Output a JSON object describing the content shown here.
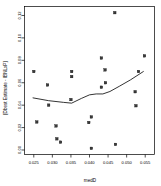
{
  "chart_data": {
    "type": "scatter",
    "title": "",
    "xlabel": "medD",
    "ylabel": "[Dbest Estimate - IBNLxP]",
    "xlim": [
      0.0225,
      0.0575
    ],
    "ylim": [
      -0.004,
      0.128
    ],
    "grid": false,
    "legend": null,
    "xticks": [
      0.025,
      0.03,
      0.035,
      0.04,
      0.045,
      0.05,
      0.055
    ],
    "xticklabels": [
      "0.025",
      "0.030",
      "0.035",
      "0.040",
      "0.045",
      "0.050",
      "0.055"
    ],
    "yticks": [
      0.0,
      0.02,
      0.04,
      0.06,
      0.08,
      0.1,
      0.12
    ],
    "yticklabels": [
      "0.00",
      "0.02",
      "0.04",
      "0.06",
      "0.08",
      "0.10",
      "0.12"
    ],
    "marker": "filled-square",
    "marker_color": "#3a3a3a",
    "points": [
      {
        "x": 0.025,
        "y": 0.07
      },
      {
        "x": 0.0258,
        "y": 0.025
      },
      {
        "x": 0.0287,
        "y": 0.058
      },
      {
        "x": 0.029,
        "y": 0.04
      },
      {
        "x": 0.031,
        "y": 0.0215
      },
      {
        "x": 0.0312,
        "y": 0.01
      },
      {
        "x": 0.0322,
        "y": 0.007
      },
      {
        "x": 0.0352,
        "y": 0.07
      },
      {
        "x": 0.0352,
        "y": 0.0655
      },
      {
        "x": 0.035,
        "y": 0.045
      },
      {
        "x": 0.0398,
        "y": 0.0245
      },
      {
        "x": 0.0405,
        "y": 0.0295
      },
      {
        "x": 0.0405,
        "y": 0.0015
      },
      {
        "x": 0.0432,
        "y": 0.082
      },
      {
        "x": 0.0432,
        "y": 0.056
      },
      {
        "x": 0.0442,
        "y": 0.0715
      },
      {
        "x": 0.0443,
        "y": 0.06
      },
      {
        "x": 0.0468,
        "y": 0.1225
      },
      {
        "x": 0.047,
        "y": 0.005
      },
      {
        "x": 0.0523,
        "y": 0.052
      },
      {
        "x": 0.0525,
        "y": 0.0395
      },
      {
        "x": 0.0532,
        "y": 0.07
      },
      {
        "x": 0.0548,
        "y": 0.084
      }
    ],
    "trend_line": {
      "name": "lowess",
      "color": "#000000",
      "x": [
        0.0248,
        0.029,
        0.033,
        0.0352,
        0.0378,
        0.04,
        0.0418,
        0.0436,
        0.0455,
        0.048,
        0.051,
        0.0545
      ],
      "y": [
        0.0465,
        0.044,
        0.0425,
        0.0418,
        0.046,
        0.0492,
        0.05,
        0.05,
        0.0522,
        0.0568,
        0.0625,
        0.07
      ]
    }
  }
}
